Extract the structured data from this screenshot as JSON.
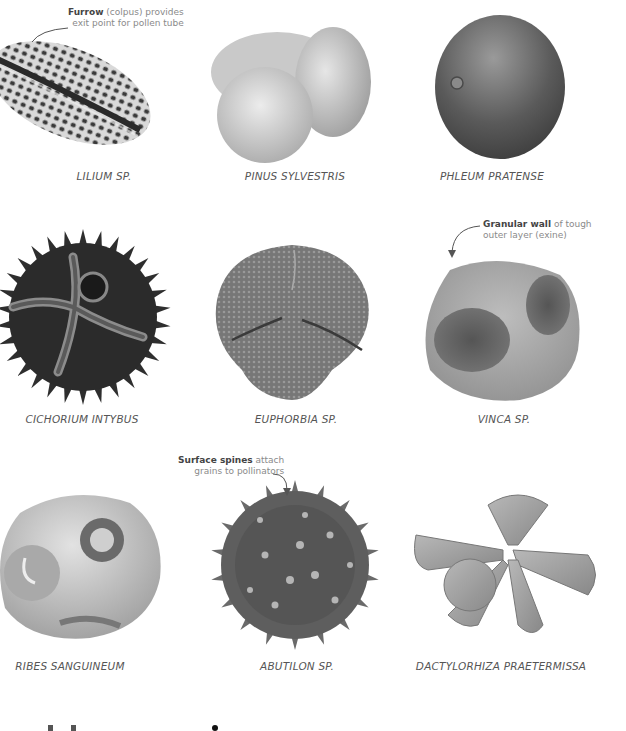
{
  "specimens": [
    {
      "name": "LILIUM SP.",
      "label_x": 104,
      "label_y": 175
    },
    {
      "name": "PINUS SYLVESTRIS",
      "label_x": 295,
      "label_y": 175
    },
    {
      "name": "PHLEUM PRATENSE",
      "label_x": 492,
      "label_y": 175
    },
    {
      "name": "CICHORIUM INTYBUS",
      "label_x": 82,
      "label_y": 418
    },
    {
      "name": "EUPHORBIA SP.",
      "label_x": 296,
      "label_y": 418
    },
    {
      "name": "VINCA SP.",
      "label_x": 504,
      "label_y": 418
    },
    {
      "name": "RIBES SANGUINEUM",
      "label_x": 70,
      "label_y": 665
    },
    {
      "name": "ABUTILON SP.",
      "label_x": 297,
      "label_y": 665
    },
    {
      "name": "DACTYLORHIZA PRAETERMISSA",
      "label_x": 501,
      "label_y": 665
    }
  ],
  "annotations": {
    "furrow": {
      "bold": "Furrow",
      "rest_line1": " (colpus) provides",
      "line2": "exit point for pollen tube"
    },
    "granular": {
      "bold": "Granular wall",
      "rest_line1": " of tough",
      "line2": "outer layer (exine)"
    },
    "spines": {
      "bold": "Surface spines",
      "rest_line1": " attach",
      "line2": "grains to pollinators"
    }
  },
  "footer": {
    "heading_fragment": "H              i"
  }
}
